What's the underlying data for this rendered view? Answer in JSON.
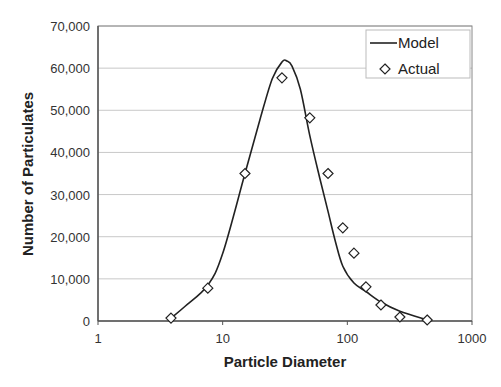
{
  "chart_data": {
    "type": "line",
    "title": "",
    "xlabel": "Particle Diameter",
    "ylabel": "Number of Particulates",
    "xscale": "log",
    "xlim": [
      1,
      1000
    ],
    "ylim": [
      0,
      70000
    ],
    "x_ticks": [
      1,
      10,
      100,
      1000
    ],
    "x_tick_labels": [
      "1",
      "10",
      "100",
      "1000"
    ],
    "y_ticks": [
      0,
      10000,
      20000,
      30000,
      40000,
      50000,
      60000,
      70000
    ],
    "y_tick_labels": [
      "0",
      "10,000",
      "20,000",
      "30,000",
      "40,000",
      "50,000",
      "60,000",
      "70,000"
    ],
    "grid": {
      "horizontal": true,
      "vertical": false
    },
    "legend": {
      "position": "top-right",
      "entries": [
        "Model",
        "Actual"
      ]
    },
    "series": [
      {
        "name": "Model",
        "style": "line",
        "color": "#222222",
        "x": [
          3.85,
          5,
          7.6,
          10,
          15.1,
          20,
          25,
          30,
          32.7,
          36,
          42,
          50,
          60,
          70,
          80,
          92,
          113,
          141,
          186,
          264,
          437
        ],
        "values": [
          700,
          3500,
          8500,
          16000,
          35000,
          48000,
          57500,
          61500,
          61700,
          60500,
          55000,
          44000,
          34000,
          26000,
          19000,
          13000,
          9000,
          7000,
          4500,
          2300,
          240
        ]
      },
      {
        "name": "Actual",
        "style": "marker-diamond",
        "color": "#222222",
        "x": [
          3.85,
          7.6,
          15.1,
          29.9,
          50,
          70,
          92,
          113,
          141,
          186,
          264,
          437
        ],
        "values": [
          700,
          7800,
          35000,
          57700,
          48200,
          35000,
          22100,
          16100,
          8100,
          3800,
          950,
          240
        ]
      }
    ]
  },
  "legend": {
    "model_label": "Model",
    "actual_label": "Actual"
  },
  "axes": {
    "x_title": "Particle Diameter",
    "y_title": "Number of Particulates"
  }
}
